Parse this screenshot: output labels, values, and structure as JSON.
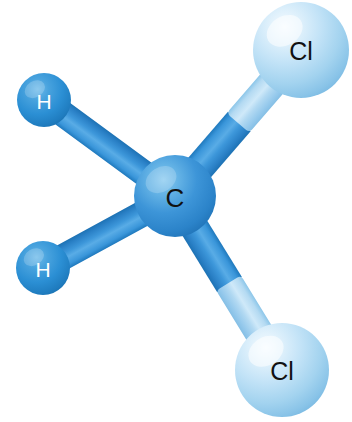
{
  "figure": {
    "name": "ball-and-stick-molecule",
    "molecule_name": "dichloromethane",
    "formula": "CH2Cl2",
    "background_color": "#ffffff",
    "width": 352,
    "height": 422
  },
  "palette": {
    "carbon_sphere_light": "#7cc2ec",
    "carbon_sphere_mid": "#3d95d8",
    "carbon_sphere_dark": "#2277bd",
    "hydrogen_sphere_light": "#5fb2e6",
    "hydrogen_sphere_mid": "#2b8fd4",
    "hydrogen_sphere_dark": "#1b6fad",
    "chlorine_sphere_light": "#eaf5fc",
    "chlorine_sphere_mid": "#b5dcf3",
    "chlorine_sphere_dark": "#7dbde4",
    "bond_dark": "#2f90d6",
    "bond_dark_edge": "#1f79bd",
    "bond_light": "#a8d6f0",
    "bond_light_edge": "#83c2e6",
    "label_dark": "#111111",
    "label_light": "#ffffff"
  },
  "atoms": [
    {
      "id": "c1",
      "element": "C",
      "label": "C",
      "name": "atom-carbon-center",
      "cx": 175,
      "cy": 196,
      "r": 41,
      "label_color": "#111111",
      "label_size": 26,
      "label_dx": 0,
      "label_dy": 2,
      "gradient": "grad-carbon"
    },
    {
      "id": "cl1",
      "element": "Cl",
      "label": "Cl",
      "name": "atom-chlorine-top-right",
      "cx": 301,
      "cy": 50,
      "r": 48,
      "label_color": "#111111",
      "label_size": 25,
      "label_dx": 0,
      "label_dy": 1,
      "gradient": "grad-chlorine"
    },
    {
      "id": "cl2",
      "element": "Cl",
      "label": "Cl",
      "name": "atom-chlorine-bottom-right",
      "cx": 282,
      "cy": 370,
      "r": 47,
      "label_color": "#111111",
      "label_size": 25,
      "label_dx": 0,
      "label_dy": 1,
      "gradient": "grad-chlorine"
    },
    {
      "id": "h1",
      "element": "H",
      "label": "H",
      "name": "atom-hydrogen-upper-left",
      "cx": 44,
      "cy": 100,
      "r": 27,
      "label_color": "#ffffff",
      "label_size": 21,
      "label_dx": 0,
      "label_dy": 1,
      "gradient": "grad-hydrogen"
    },
    {
      "id": "h2",
      "element": "H",
      "label": "H",
      "name": "atom-hydrogen-lower-left",
      "cx": 43,
      "cy": 268,
      "r": 27,
      "label_color": "#ffffff",
      "label_size": 21,
      "label_dx": 0,
      "label_dy": 1,
      "gradient": "grad-hydrogen"
    }
  ],
  "bonds": [
    {
      "id": "b-c-cl1",
      "name": "bond-carbon-chlorine-top-right",
      "from": "c1",
      "to": "cl1",
      "x1": 175,
      "y1": 196,
      "x2": 301,
      "y2": 50,
      "width": 30,
      "two_tone": true,
      "near_color": "bond_dark",
      "far_color": "bond_light",
      "split": 0.5
    },
    {
      "id": "b-c-cl2",
      "name": "bond-carbon-chlorine-bottom-right",
      "from": "c1",
      "to": "cl2",
      "x1": 175,
      "y1": 196,
      "x2": 282,
      "y2": 370,
      "width": 29,
      "two_tone": true,
      "near_color": "bond_dark",
      "far_color": "bond_light",
      "split": 0.5
    },
    {
      "id": "b-c-h1",
      "name": "bond-carbon-hydrogen-upper-left",
      "from": "c1",
      "to": "h1",
      "x1": 175,
      "y1": 196,
      "x2": 44,
      "y2": 100,
      "width": 26,
      "two_tone": false,
      "near_color": "bond_dark",
      "far_color": "bond_dark",
      "split": 1.0
    },
    {
      "id": "b-c-h2",
      "name": "bond-carbon-hydrogen-lower-left",
      "from": "c1",
      "to": "h2",
      "x1": 175,
      "y1": 196,
      "x2": 43,
      "y2": 268,
      "width": 26,
      "two_tone": false,
      "near_color": "bond_dark",
      "far_color": "bond_dark",
      "split": 1.0
    }
  ]
}
